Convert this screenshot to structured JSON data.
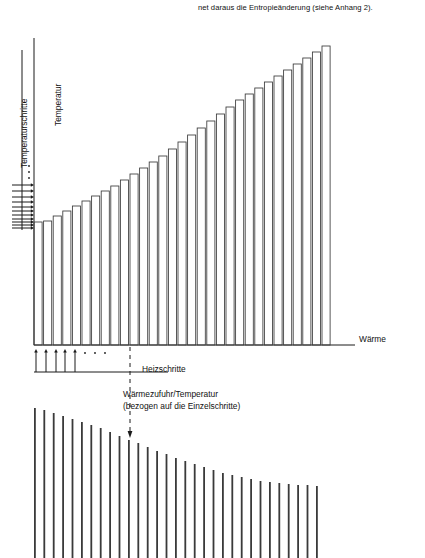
{
  "figure": {
    "top_caption": "net daraus die Entropieänderung (siehe Anhang 2).",
    "axis_labels": {
      "y_top": "Temperatur",
      "y_left": "Temperaturschritte",
      "x_right": "Wärme"
    },
    "annotations": {
      "heizschritte": "Heizschritte",
      "waermezufuhr": "Wärmezufuhr/Temperatur\n(bezogen auf die Einzelschritte)"
    },
    "ellipsis_marks": {
      "left_axis": "...",
      "below_axis": "..."
    },
    "colors": {
      "ink": "#1a1a1a",
      "bar_stroke": "#3a3a3a",
      "axis": "#1a1a1a",
      "background": "#ffffff"
    }
  },
  "chart_data": [
    {
      "id": "main-staircase-chart",
      "type": "bar",
      "title": "",
      "xlabel": "Wärme",
      "ylabel": "Temperatur",
      "description": "Outlined bars of increasing height tracing a concave (logarithmic) rise: temperature versus cumulative heat input in equal heating steps.",
      "grid": false,
      "legend": null,
      "bar_fill": "none",
      "x_axis": {
        "x0": 34,
        "x1": 355,
        "y": 345,
        "baseline": 345
      },
      "y_axis": {
        "x": 34,
        "y_top": 38,
        "y_bottom": 345
      },
      "n_bars": 31,
      "bar_left_px": 34,
      "bar_pitch_px": 9.6,
      "bar_width_px": 8.1,
      "bar_tops_px": [
        222,
        221,
        216,
        211,
        206,
        201,
        196,
        191,
        186,
        180,
        174,
        168,
        162,
        156,
        149,
        142,
        135,
        128,
        121,
        114,
        107,
        100,
        94,
        88,
        82,
        76,
        70,
        64,
        58,
        52,
        46
      ],
      "values": [
        0.4,
        0.41,
        0.42,
        0.44,
        0.45,
        0.47,
        0.49,
        0.5,
        0.52,
        0.54,
        0.56,
        0.58,
        0.6,
        0.62,
        0.64,
        0.66,
        0.69,
        0.71,
        0.73,
        0.75,
        0.78,
        0.8,
        0.82,
        0.84,
        0.86,
        0.88,
        0.9,
        0.92,
        0.94,
        0.96,
        0.98
      ],
      "categories": [
        "1",
        "2",
        "3",
        "4",
        "5",
        "6",
        "7",
        "8",
        "9",
        "10",
        "11",
        "12",
        "13",
        "14",
        "15",
        "16",
        "17",
        "18",
        "19",
        "20",
        "21",
        "22",
        "23",
        "24",
        "25",
        "26",
        "27",
        "28",
        "29",
        "30",
        "31"
      ]
    },
    {
      "id": "left-temperature-steps",
      "type": "bar",
      "description": "Horizontal arrows on the left margin marking successive temperature steps; spacing grows upward, ellipsis indicates continuation.",
      "orientation": "horizontal",
      "arrow_x_start": 12,
      "arrow_x_end": 34,
      "arrow_y_px": [
        228,
        225,
        222,
        219,
        215,
        211,
        207,
        202,
        197,
        191,
        185
      ],
      "ellipsis_y_px": [
        178,
        172,
        166
      ],
      "bracket": {
        "x": 22,
        "y_top": 50,
        "y_bottom": 230
      },
      "label": "Temperaturschritte"
    },
    {
      "id": "heating-steps-arrows",
      "type": "bar",
      "description": "Upward arrows below the x-axis marking equal heat increments (Heizschritte), followed by an ellipsis and a horizontal extent line.",
      "orientation": "vertical-up",
      "arrow_y_start": 372,
      "arrow_y_end": 349,
      "arrow_x_px": [
        36,
        46,
        56,
        65,
        75
      ],
      "ellipsis_x_px": [
        85,
        95,
        105
      ],
      "extent_line": {
        "x0": 34,
        "x1": 137,
        "y": 372
      },
      "label": "Heizschritte"
    },
    {
      "id": "bottom-ratio-chart",
      "type": "bar",
      "title": "Wärmezufuhr/Temperatur (bezogen auf die Einzelschritte)",
      "description": "Thin vertical lines of decreasing height, flattening to the right: heat input divided by temperature for each single step.",
      "grid": false,
      "legend": null,
      "n_bars": 31,
      "bar_left_px": 34,
      "bar_pitch_px": 9.4,
      "bar_width_px": 1.8,
      "bar_bottom_px": 558,
      "bar_tops_px": [
        408,
        410,
        413,
        416,
        419,
        422,
        425,
        428,
        432,
        436,
        440,
        443,
        447,
        451,
        454,
        458,
        461,
        464,
        467,
        470,
        473,
        475,
        477,
        479,
        481,
        482,
        483,
        484,
        485,
        485,
        486
      ],
      "values": [
        1.0,
        0.99,
        0.97,
        0.95,
        0.94,
        0.92,
        0.9,
        0.88,
        0.86,
        0.83,
        0.81,
        0.79,
        0.77,
        0.74,
        0.72,
        0.7,
        0.68,
        0.66,
        0.64,
        0.62,
        0.61,
        0.59,
        0.58,
        0.57,
        0.56,
        0.55,
        0.54,
        0.54,
        0.53,
        0.53,
        0.53
      ],
      "categories": [
        "1",
        "2",
        "3",
        "4",
        "5",
        "6",
        "7",
        "8",
        "9",
        "10",
        "11",
        "12",
        "13",
        "14",
        "15",
        "16",
        "17",
        "18",
        "19",
        "20",
        "21",
        "22",
        "23",
        "24",
        "25",
        "26",
        "27",
        "28",
        "29",
        "30",
        "31"
      ]
    }
  ]
}
